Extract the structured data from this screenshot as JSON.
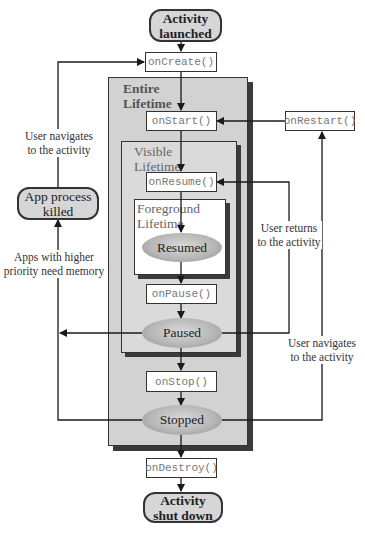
{
  "terminals": {
    "launched": "Activity launched",
    "launched_line1": "Activity",
    "launched_line2": "launched",
    "shutdown_line1": "Activity",
    "shutdown_line2": "shut down",
    "killed_line1": "App process",
    "killed_line2": "killed"
  },
  "lifetimes": {
    "entire_line1": "Entire",
    "entire_line2": "Lifetime",
    "visible_line1": "Visible",
    "visible_line2": "Lifetime",
    "foreground_line1": "Foreground",
    "foreground_line2": "Lifetime"
  },
  "methods": {
    "onCreate": "onCreate()",
    "onStart": "onStart()",
    "onRestart": "onRestart()",
    "onResume": "onResume()",
    "onPause": "onPause()",
    "onStop": "onStop()",
    "onDestroy": "onDestroy()"
  },
  "states": {
    "resumed": "Resumed",
    "paused": "Paused",
    "stopped": "Stopped"
  },
  "notes": {
    "user_navigates_left_1": "User navigates",
    "user_navigates_left_2": "to the activity",
    "apps_priority_1": "Apps with higher",
    "apps_priority_2": "priority need memory",
    "user_returns_1": "User returns",
    "user_returns_2": "to the activity",
    "user_navigates_right_1": "User navigates",
    "user_navigates_right_2": "to the activity"
  },
  "colors": {
    "line": "#1a1a1a",
    "entire_bg": "#d2d2d2",
    "visible_bg": "#dadada",
    "foreground_bg": "#ffffff",
    "shadow": "#3a3a3a"
  }
}
